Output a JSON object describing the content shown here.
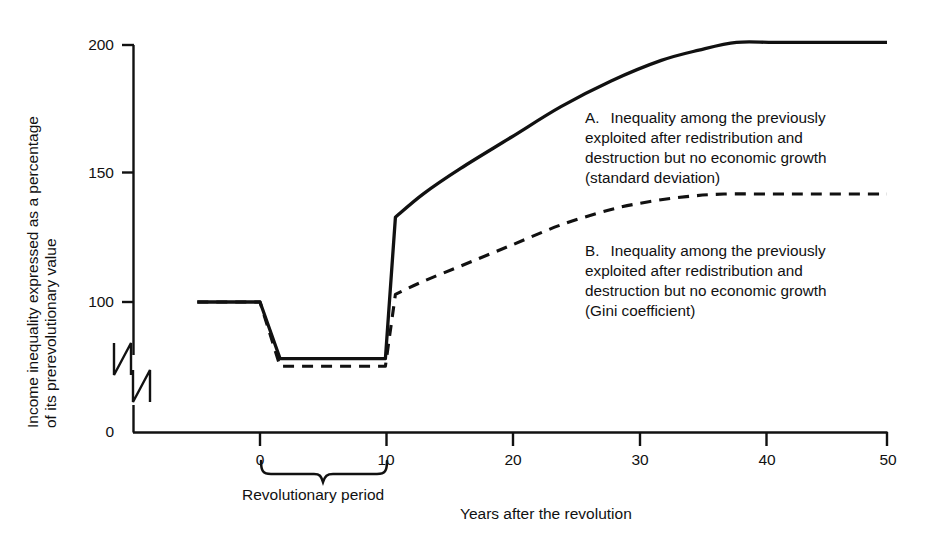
{
  "chart_data": {
    "type": "line",
    "title": "",
    "xlabel": "Years after the revolution",
    "ylabel_line1": "Income inequality expressed as a percentage",
    "ylabel_line2": "of its prerevolutionary value",
    "xlim": [
      -5,
      50
    ],
    "ylim": [
      0,
      200
    ],
    "y_axis_break": true,
    "y_axis_break_note": "axis broken between 0 and 100",
    "grid": false,
    "legend_position": "inside-right",
    "xticks": [
      0,
      10,
      20,
      30,
      40,
      50
    ],
    "xtick_labels": [
      "0",
      "10",
      "20",
      "30",
      "40",
      "50"
    ],
    "yticks": [
      0,
      100,
      150,
      200
    ],
    "ytick_labels": [
      "0",
      "100",
      "150",
      "200"
    ],
    "annotations": [
      {
        "name": "revolutionary-period-brace",
        "text": "Revolutionary period",
        "x_start": 0,
        "x_end": 10
      }
    ],
    "series": [
      {
        "name": "A",
        "label_key": "A",
        "style": "solid",
        "color": "#111111",
        "x": [
          -5,
          0,
          1.6,
          10,
          10.8,
          13,
          16,
          20,
          24,
          28,
          32,
          35,
          38,
          41,
          45,
          50
        ],
        "values": [
          100,
          100,
          78,
          78,
          133,
          142,
          152,
          164,
          176,
          186,
          194,
          198,
          201,
          201,
          201,
          201
        ]
      },
      {
        "name": "B",
        "label_key": "B",
        "style": "dashed",
        "color": "#111111",
        "x": [
          -5,
          0,
          1.6,
          10,
          10.8,
          13,
          16,
          20,
          24,
          28,
          31,
          34,
          37,
          41,
          45,
          50
        ],
        "values": [
          100,
          100,
          75,
          75,
          103,
          108,
          114,
          122,
          130,
          136,
          139,
          141,
          142,
          142,
          142,
          142
        ]
      }
    ]
  },
  "axis": {
    "y_title_line1": "Income inequality expressed as a percentage",
    "y_title_line2": "of its prerevolutionary value",
    "x_title": "Years after the revolution",
    "yticks": [
      "200",
      "150",
      "100",
      "0"
    ],
    "xticks": [
      "0",
      "10",
      "20",
      "30",
      "40",
      "50"
    ]
  },
  "brace": {
    "caption": "Revolutionary period"
  },
  "legend": {
    "a": {
      "marker": "A.",
      "line1": "Inequality among the previously",
      "line2": "exploited after redistribution and",
      "line3": "destruction but no economic growth",
      "line4": "(standard deviation)"
    },
    "b": {
      "marker": "B.",
      "line1": "Inequality among the previously",
      "line2": "exploited after redistribution and",
      "line3": "destruction but no economic growth",
      "line4": "(Gini coefficient)"
    }
  },
  "colors": {
    "ink": "#111111",
    "background": "#ffffff"
  }
}
